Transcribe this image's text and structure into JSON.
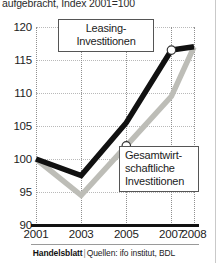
{
  "header": {
    "subtitle": "aufgebracht, Index 2001=100"
  },
  "footer": {
    "brand": "Handelsblatt",
    "separator": "|",
    "sources": "Quellen: ifo institut, BDL"
  },
  "callouts": {
    "leasing": {
      "line1": "Leasing-",
      "line2": "Investitionen"
    },
    "gesamt": {
      "line1": "Gesamtwirt-",
      "line2": "schaftliche",
      "line3": "Investitionen"
    }
  },
  "axis": {
    "y_ticks": [
      "120",
      "115",
      "110",
      "105",
      "100",
      "95",
      "90"
    ],
    "x_ticks": [
      "2001",
      "2003",
      "2005",
      "2007",
      "2008"
    ]
  },
  "chart_data": {
    "type": "line",
    "title": "",
    "subtitle": "aufgebracht, Index 2001=100",
    "xlabel": "",
    "ylabel": "Index 2001=100",
    "x": [
      2001,
      2003,
      2005,
      2007,
      2008
    ],
    "xlim": [
      2001,
      2008
    ],
    "ylim": [
      90,
      120
    ],
    "yticks": [
      90,
      95,
      100,
      105,
      110,
      115,
      120
    ],
    "xticks": [
      2001,
      2003,
      2005,
      2007,
      2008
    ],
    "grid": true,
    "legend": "annotations",
    "series": [
      {
        "name": "Leasing-Investitionen",
        "color": "#111111",
        "values": [
          100,
          97.5,
          105.5,
          116.5,
          117
        ],
        "markers": [
          {
            "x": 2007,
            "y": 116.5
          }
        ]
      },
      {
        "name": "Gesamtwirtschaftliche Investitionen",
        "color": "#bdbdb7",
        "values": [
          100,
          94.5,
          102,
          109.5,
          117
        ],
        "markers": [
          {
            "x": 2005,
            "y": 102
          }
        ]
      }
    ],
    "annotations": [
      {
        "text": "Leasing-Investitionen",
        "points_to": {
          "x": 2007,
          "y": 116.5
        }
      },
      {
        "text": "Gesamtwirtschaftliche Investitionen",
        "points_to": {
          "x": 2005,
          "y": 102
        }
      }
    ]
  }
}
